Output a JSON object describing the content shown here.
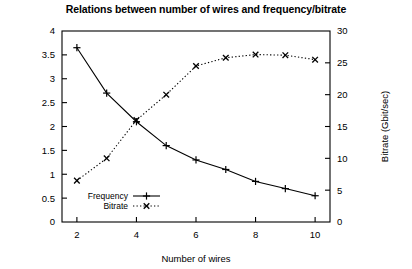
{
  "chart_data": {
    "type": "line",
    "title": "Relations between number of wires and frequency/bitrate",
    "xlabel": "Number of wires",
    "ylabel": "",
    "y2label": "Bitrate (Gbit/sec)",
    "x": [
      2,
      3,
      4,
      5,
      6,
      7,
      8,
      9,
      10
    ],
    "xlim": [
      1.5,
      10.5
    ],
    "ylim": [
      0,
      4
    ],
    "y2lim": [
      0,
      30
    ],
    "xticks": [
      2,
      4,
      6,
      8,
      10
    ],
    "xticklabels": [
      "2",
      "4",
      "6",
      "8",
      "10"
    ],
    "yticks": [
      0,
      0.5,
      1,
      1.5,
      2,
      2.5,
      3,
      3.5,
      4
    ],
    "yticklabels": [
      "0",
      "0.5",
      "1",
      "1.5",
      "2",
      "2.5",
      "3",
      "3.5",
      "4"
    ],
    "y2ticks": [
      0,
      5,
      10,
      15,
      20,
      25,
      30
    ],
    "y2ticklabels": [
      "0",
      "5",
      "10",
      "15",
      "20",
      "25",
      "30"
    ],
    "grid": false,
    "legend_position": "lower-left-inside",
    "series": [
      {
        "name": "Frequency",
        "axis": "left",
        "marker": "plus",
        "linestyle": "solid",
        "color": "#000000",
        "values": [
          3.65,
          2.7,
          2.1,
          1.6,
          1.3,
          1.1,
          0.85,
          0.7,
          0.55
        ]
      },
      {
        "name": "Bitrate",
        "axis": "right",
        "marker": "cross",
        "linestyle": "dotted",
        "color": "#000000",
        "values": [
          6.5,
          10.0,
          16.0,
          20.0,
          24.5,
          25.8,
          26.3,
          26.2,
          25.5
        ]
      }
    ]
  },
  "legend": {
    "entries": [
      {
        "label": "Frequency"
      },
      {
        "label": "Bitrate"
      }
    ]
  }
}
